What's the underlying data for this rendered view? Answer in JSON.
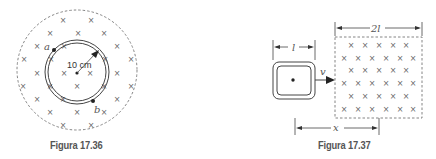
{
  "figures": [
    {
      "id": "17.36",
      "caption": "Figura 17.36",
      "labels": {
        "point_a": "a",
        "point_b": "b",
        "radius": "10 cm"
      },
      "description": "Circular conducting ring of radius 10 cm inside a circular region of magnetic field directed into the page (×)"
    },
    {
      "id": "17.37",
      "caption": "Figura 17.37",
      "labels": {
        "loop_side": "l",
        "field_width": "2l",
        "velocity": "v",
        "distance": "x"
      },
      "description": "Square loop of side l moving with velocity v toward a square region of width 2l with magnetic field into the page (×)"
    }
  ],
  "symbols": {
    "field_into_page": "×"
  },
  "colors": {
    "line": "#444444",
    "dashed": "#777777",
    "caption": "#555555"
  }
}
